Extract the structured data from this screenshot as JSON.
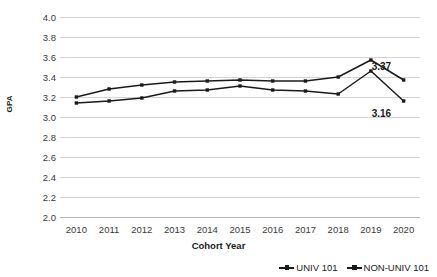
{
  "chart_data": {
    "type": "line",
    "title": "",
    "xlabel": "Cohort Year",
    "ylabel": "GPA",
    "categories": [
      "2010",
      "2011",
      "2012",
      "2013",
      "2014",
      "2015",
      "2016",
      "2017",
      "2018",
      "2019",
      "2020"
    ],
    "x": [
      2010,
      2011,
      2012,
      2013,
      2014,
      2015,
      2016,
      2017,
      2018,
      2019,
      2020
    ],
    "ylim": [
      2.0,
      4.0
    ],
    "ytick_step": 0.2,
    "ytick_labels": [
      "4.0",
      "3.8",
      "3.6",
      "3.4",
      "3.2",
      "3.0",
      "2.8",
      "2.6",
      "2.4",
      "2.2",
      "2.0"
    ],
    "ytick_values": [
      4.0,
      3.8,
      3.6,
      3.4,
      3.2,
      3.0,
      2.8,
      2.6,
      2.4,
      2.2,
      2.0
    ],
    "grid": true,
    "legend_position": "bottom-right",
    "series": [
      {
        "name": "UNIV 101",
        "color": "#1a1a1a",
        "marker": "square",
        "values": [
          3.2,
          3.28,
          3.32,
          3.35,
          3.36,
          3.37,
          3.36,
          3.36,
          3.4,
          3.57,
          3.37
        ]
      },
      {
        "name": "NON-UNIV 101",
        "color": "#1a1a1a",
        "marker": "square",
        "values": [
          3.14,
          3.16,
          3.19,
          3.26,
          3.27,
          3.31,
          3.27,
          3.26,
          3.23,
          3.46,
          3.16
        ]
      }
    ],
    "annotations": [
      {
        "text": "3.37",
        "series": "UNIV 101",
        "category": "2020",
        "value": 3.37
      },
      {
        "text": "3.16",
        "series": "NON-UNIV 101",
        "category": "2020",
        "value": 3.16
      }
    ]
  }
}
